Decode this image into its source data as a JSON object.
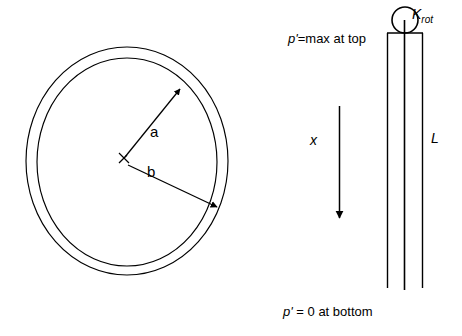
{
  "figure": {
    "background_color": "#ffffff",
    "stroke_color": "#000000",
    "width": 462,
    "height": 336
  },
  "left_diagram": {
    "name": "annulus-cross-section",
    "description": "Two concentric circles forming an annulus with radius dimension arrows",
    "radius_inner": {
      "label": "a",
      "arrow_from": "center",
      "arrow_to": "inner-circle",
      "direction": "up-right"
    },
    "radius_outer": {
      "label": "b",
      "arrow_from": "center",
      "arrow_to": "outer-circle",
      "direction": "down-right"
    },
    "center_marker": "tick"
  },
  "right_diagram": {
    "name": "rod-with-rotational-spring",
    "spring_label": {
      "base": "K",
      "subscript": "rot"
    },
    "length_label": "L",
    "axis_label": "x",
    "axis_direction": "downward",
    "top_condition": {
      "variable": "p'",
      "text": "=max at top",
      "full": "p'=max at top"
    },
    "bottom_condition": {
      "variable": "p'",
      "text": " = 0 at bottom",
      "full": "p' = 0 at bottom"
    }
  }
}
